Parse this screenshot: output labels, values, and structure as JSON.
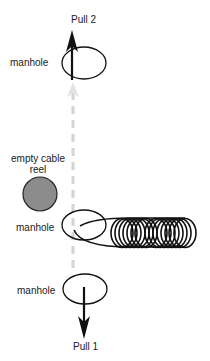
{
  "diagram": {
    "labels": {
      "pull2": "Pull 2",
      "pull1": "Pull 1",
      "manhole_top": "manhole",
      "manhole_middle": "manhole",
      "manhole_bottom": "manhole",
      "reel_line1": "empty cable",
      "reel_line2": "reel"
    },
    "colors": {
      "stroke": "#111111",
      "reel_fill": "#8c8c8c",
      "dashed_path": "#d4d4d4"
    },
    "elements": [
      {
        "id": "manhole-top",
        "shape": "ellipse"
      },
      {
        "id": "manhole-middle",
        "shape": "ellipse"
      },
      {
        "id": "manhole-bottom",
        "shape": "ellipse"
      },
      {
        "id": "empty-cable-reel",
        "shape": "circle"
      },
      {
        "id": "cable-coil",
        "shape": "coil"
      },
      {
        "id": "pull-2-arrow",
        "direction": "up"
      },
      {
        "id": "pull-1-arrow",
        "direction": "down"
      },
      {
        "id": "cable-path",
        "style": "dashed"
      }
    ]
  }
}
